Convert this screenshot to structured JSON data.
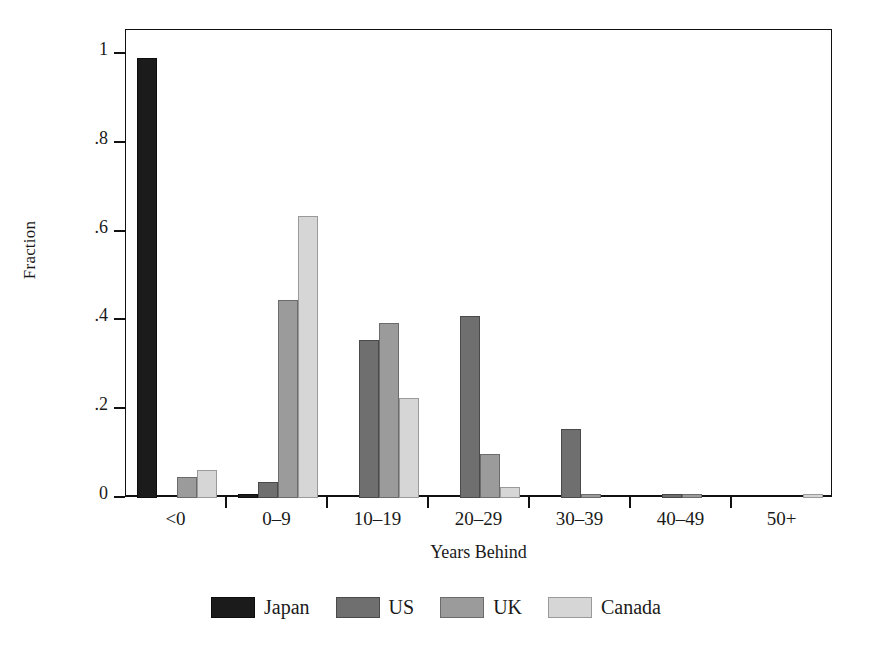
{
  "chart_data": {
    "type": "bar",
    "title": "",
    "subtitle": "",
    "xlabel": "Years Behind",
    "ylabel": "Fraction",
    "categories": [
      "<0",
      "0–9",
      "10–19",
      "20–29",
      "30–39",
      "40–49",
      "50+"
    ],
    "series": [
      {
        "name": "Japan",
        "color": "#1b1b1b",
        "values": [
          0.99,
          0.008,
          0.0,
          0.0,
          0.0,
          0.0,
          0.0
        ]
      },
      {
        "name": "US",
        "color": "#6f6f6f",
        "values": [
          0.0,
          0.035,
          0.355,
          0.41,
          0.155,
          0.008,
          0.0
        ]
      },
      {
        "name": "UK",
        "color": "#9b9b9b",
        "values": [
          0.047,
          0.445,
          0.395,
          0.1,
          0.008,
          0.008,
          0.0
        ]
      },
      {
        "name": "Canada",
        "color": "#d6d6d6",
        "values": [
          0.062,
          0.635,
          0.225,
          0.025,
          0.0,
          0.0,
          0.008
        ]
      }
    ],
    "ylim": [
      0,
      1.06
    ],
    "ytick_values": [
      0,
      0.2,
      0.4,
      0.6,
      0.8,
      1.0
    ],
    "ytick_labels": [
      "0",
      ".2",
      ".4",
      ".6",
      ".8",
      "1"
    ],
    "grid": false,
    "legend_position": "bottom-center",
    "frame": "box"
  }
}
